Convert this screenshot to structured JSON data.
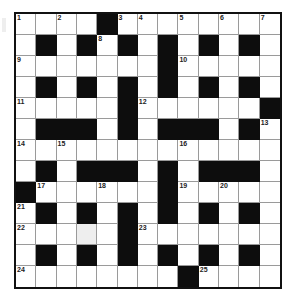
{
  "puzzle": {
    "rows": 13,
    "cols": 13,
    "layout": [
      "....#........",
      ".#.#.#.#.#.#.",
      ".......#.....",
      ".#.#.#.#.#.#.",
      ".....#......#",
      ".###.#.###.#.",
      ".............",
      ".#.###.#.###.",
      "#......#.....",
      ".#.#.#.#.#.#.",
      ".....#.......",
      ".#.#.#.#.#.#.",
      "........#...."
    ],
    "numbers": [
      {
        "r": 0,
        "c": 0,
        "n": "1"
      },
      {
        "r": 0,
        "c": 2,
        "n": "2"
      },
      {
        "r": 0,
        "c": 5,
        "n": "3"
      },
      {
        "r": 0,
        "c": 6,
        "n": "4"
      },
      {
        "r": 0,
        "c": 8,
        "n": "5"
      },
      {
        "r": 0,
        "c": 10,
        "n": "6"
      },
      {
        "r": 0,
        "c": 12,
        "n": "7"
      },
      {
        "r": 1,
        "c": 4,
        "n": "8"
      },
      {
        "r": 2,
        "c": 0,
        "n": "9"
      },
      {
        "r": 2,
        "c": 8,
        "n": "10"
      },
      {
        "r": 4,
        "c": 0,
        "n": "11"
      },
      {
        "r": 4,
        "c": 6,
        "n": "12"
      },
      {
        "r": 5,
        "c": 12,
        "n": "13"
      },
      {
        "r": 6,
        "c": 0,
        "n": "14"
      },
      {
        "r": 6,
        "c": 2,
        "n": "15"
      },
      {
        "r": 6,
        "c": 8,
        "n": "16"
      },
      {
        "r": 8,
        "c": 1,
        "n": "17"
      },
      {
        "r": 8,
        "c": 4,
        "n": "18"
      },
      {
        "r": 8,
        "c": 8,
        "n": "19"
      },
      {
        "r": 8,
        "c": 10,
        "n": "20"
      },
      {
        "r": 9,
        "c": 0,
        "n": "21"
      },
      {
        "r": 10,
        "c": 0,
        "n": "22"
      },
      {
        "r": 10,
        "c": 6,
        "n": "23"
      },
      {
        "r": 12,
        "c": 0,
        "n": "24"
      },
      {
        "r": 12,
        "c": 9,
        "n": "25"
      }
    ],
    "shaded_cells": [
      {
        "r": 10,
        "c": 3
      }
    ],
    "colors": {
      "block": "#0d0d0d",
      "cell": "#ffffff",
      "gridline": "#9a9a9a",
      "border": "#111111"
    }
  }
}
